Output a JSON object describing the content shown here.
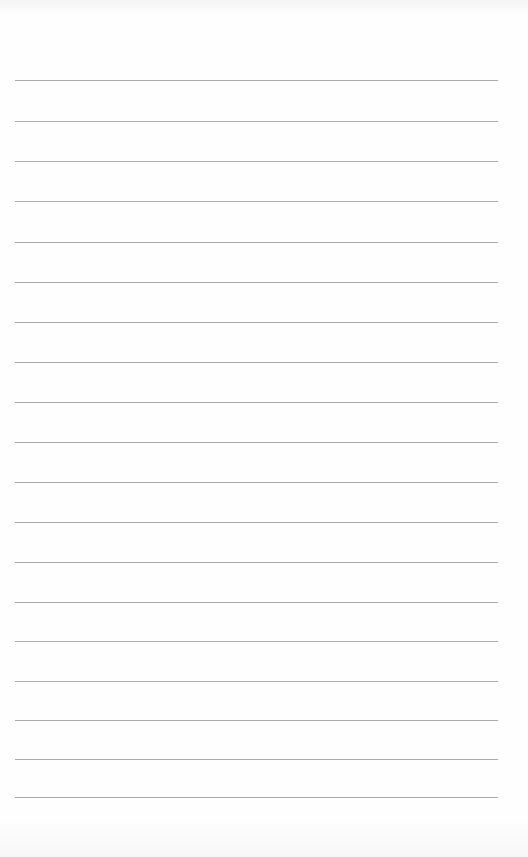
{
  "page": {
    "type": "blank lined paper",
    "background_color": "#fefefe",
    "rule_color": "#9c9c9c"
  },
  "ruling": {
    "line_count": 19,
    "x_start": 15,
    "x_end": 498,
    "line_y": [
      80,
      121,
      161,
      201,
      242,
      282,
      322,
      362,
      402,
      442,
      482,
      522,
      562,
      602,
      641,
      681,
      720,
      759,
      797
    ]
  }
}
